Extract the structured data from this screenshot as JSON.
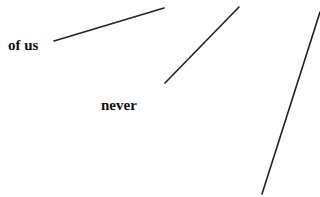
{
  "labels": {
    "of_us": "of us",
    "never": "never"
  },
  "lines": [
    {
      "x1": 54,
      "y1": 41,
      "x2": 164,
      "y2": 8
    },
    {
      "x1": 165,
      "y1": 83,
      "x2": 239,
      "y2": 7
    },
    {
      "x1": 262,
      "y1": 194,
      "x2": 320,
      "y2": 12
    }
  ],
  "colors": {
    "line": "#222222",
    "text": "#111111",
    "background": "#ffffff"
  }
}
